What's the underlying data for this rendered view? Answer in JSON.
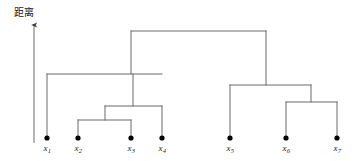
{
  "figure": {
    "type": "dendrogram",
    "axis_label": "距离",
    "background_color": "#ffffff",
    "line_color": "#6b6b6b",
    "axis_color": "#4d4d4d",
    "node_color": "#000000"
  },
  "axis": {
    "name": "distance-axis",
    "label": "距离",
    "label_x": 14,
    "label_y": 6,
    "arrow_x": 34,
    "arrow_top_y": 20,
    "arrow_bottom_y": 143,
    "direction": "up"
  },
  "leaves": [
    {
      "id": "x1",
      "base": "x",
      "sub": "1",
      "x": 47,
      "y": 138,
      "stem_top": 74
    },
    {
      "id": "x2",
      "base": "x",
      "sub": "2",
      "x": 78,
      "y": 138,
      "stem_top": 120
    },
    {
      "id": "x3",
      "base": "x",
      "sub": "3",
      "x": 131,
      "y": 138,
      "stem_top": 120
    },
    {
      "id": "x4",
      "base": "x",
      "sub": "4",
      "x": 162,
      "y": 138,
      "stem_top": 106
    },
    {
      "id": "x5",
      "base": "x",
      "sub": "5",
      "x": 230,
      "y": 138,
      "stem_top": 85
    },
    {
      "id": "x6",
      "base": "x",
      "sub": "6",
      "x": 286,
      "y": 138,
      "stem_top": 102
    },
    {
      "id": "x7",
      "base": "x",
      "sub": "7",
      "x": 337,
      "y": 138,
      "stem_top": 102
    }
  ],
  "merges": [
    {
      "id": "m1",
      "name": "merge-x2-x3",
      "left_x": 78,
      "right_x": 131,
      "y": 120,
      "stem_top": 106,
      "center_x": 105
    },
    {
      "id": "m2",
      "name": "merge-x2x3-x4",
      "left_x": 105,
      "right_x": 162,
      "y": 106,
      "stem_top": 74,
      "center_x": 133
    },
    {
      "id": "m3",
      "name": "merge-x1-cluster",
      "left_x": 47,
      "right_x": 162,
      "y": 74,
      "stem_top": 31,
      "center_x": 131
    },
    {
      "id": "m4",
      "name": "merge-x6-x7",
      "left_x": 286,
      "right_x": 337,
      "y": 102,
      "stem_top": 85,
      "center_x": 311
    },
    {
      "id": "m5",
      "name": "merge-x5-x6x7",
      "left_x": 230,
      "right_x": 311,
      "y": 85,
      "stem_top": 31,
      "center_x": 266
    },
    {
      "id": "m6",
      "name": "merge-root",
      "left_x": 131,
      "right_x": 266,
      "y": 31,
      "stem_top": null,
      "center_x": 198
    }
  ],
  "chart_data": {
    "type": "dendrogram",
    "title": "",
    "xlabel": "",
    "ylabel": "距离",
    "leaf_labels": [
      "x1",
      "x2",
      "x3",
      "x4",
      "x5",
      "x6",
      "x7"
    ],
    "leaf_order": [
      "x1",
      "x2",
      "x3",
      "x4",
      "x5",
      "x6",
      "x7"
    ],
    "linkage_steps": [
      {
        "step": 1,
        "merged": [
          "x2",
          "x3"
        ],
        "height_px": 120,
        "height_rank": 1
      },
      {
        "step": 2,
        "merged": [
          "{x2,x3}",
          "x4"
        ],
        "height_px": 106,
        "height_rank": 2
      },
      {
        "step": 3,
        "merged": [
          "x6",
          "x7"
        ],
        "height_px": 102,
        "height_rank": 3
      },
      {
        "step": 4,
        "merged": [
          "x5",
          "{x6,x7}"
        ],
        "height_px": 85,
        "height_rank": 4
      },
      {
        "step": 5,
        "merged": [
          "x1",
          "{x2,x3,x4}"
        ],
        "height_px": 74,
        "height_rank": 5
      },
      {
        "step": 6,
        "merged": [
          "{x1,x2,x3,x4}",
          "{x5,x6,x7}"
        ],
        "height_px": 31,
        "height_rank": 6
      }
    ],
    "clusters_top_level": [
      [
        "x1",
        "x2",
        "x3",
        "x4"
      ],
      [
        "x5",
        "x6",
        "x7"
      ]
    ],
    "axis_direction": "distance increases upward",
    "grid": false,
    "legend": "none"
  }
}
